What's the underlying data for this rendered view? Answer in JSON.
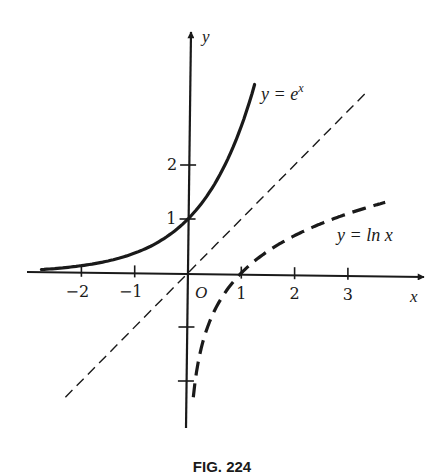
{
  "chart_data": {
    "type": "line",
    "title": "",
    "caption": "FIG. 224",
    "xlabel": "x",
    "ylabel": "y",
    "origin_label": "O",
    "xlim": [
      -3,
      4
    ],
    "ylim": [
      -3,
      4
    ],
    "grid": false,
    "x_ticks": [
      -2,
      -1,
      1,
      2,
      3
    ],
    "x_tick_labels": [
      "−2",
      "−1",
      "1",
      "2",
      "3"
    ],
    "y_ticks": [
      -2,
      -1,
      1,
      2
    ],
    "y_tick_labels": [
      "",
      "",
      "1",
      "2"
    ],
    "series": [
      {
        "name": "y = e^x",
        "label": "y = e",
        "label_sup": "x",
        "style": "solid",
        "x_range": [
          -2.75,
          1.25
        ],
        "points": [
          [
            -2.75,
            0.064
          ],
          [
            -2,
            0.135
          ],
          [
            -1,
            0.368
          ],
          [
            0,
            1
          ],
          [
            0.5,
            1.649
          ],
          [
            1,
            2.718
          ],
          [
            1.25,
            3.49
          ]
        ]
      },
      {
        "name": "y = ln x",
        "label": "y = ln x",
        "style": "dashed-heavy",
        "x_range": [
          0.1,
          3.7
        ],
        "points": [
          [
            0.1,
            -2.3
          ],
          [
            0.25,
            -1.386
          ],
          [
            0.5,
            -0.693
          ],
          [
            1,
            0
          ],
          [
            2,
            0.693
          ],
          [
            3,
            1.099
          ],
          [
            3.7,
            1.308
          ]
        ]
      },
      {
        "name": "y = x",
        "label": "",
        "style": "dashed-thin",
        "x_range": [
          -2.3,
          3.35
        ],
        "points": [
          [
            -2.3,
            -2.3
          ],
          [
            0,
            0
          ],
          [
            3.35,
            3.35
          ]
        ]
      }
    ]
  }
}
